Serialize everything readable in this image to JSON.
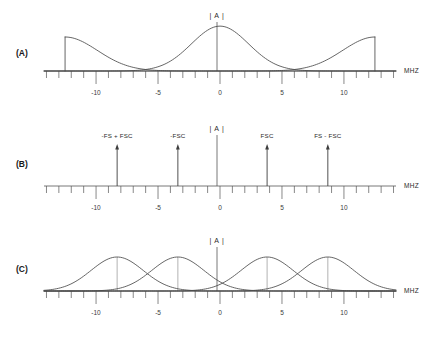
{
  "figure": {
    "background_color": "#ffffff",
    "line_color": "#4a4a4a",
    "axis_color": "#555555",
    "amplitude_label": "| A |",
    "frequency_unit_label": "MHZ"
  },
  "axis": {
    "min": -14.2,
    "max": 14.2,
    "tick_step": 1,
    "major_step": 5,
    "tick_labels": [
      {
        "value": -10,
        "text": "-10"
      },
      {
        "value": -5,
        "text": "-5"
      },
      {
        "value": 0,
        "text": "0"
      },
      {
        "value": 5,
        "text": "5"
      },
      {
        "value": 10,
        "text": "10"
      }
    ]
  },
  "panels": [
    {
      "id": "A",
      "label": "(A)",
      "amplitude_label": "| A |",
      "unit_label": "MHZ"
    },
    {
      "id": "B",
      "label": "(B)",
      "amplitude_label": "| A |",
      "unit_label": "MHZ"
    },
    {
      "id": "C",
      "label": "(C)",
      "amplitude_label": "| A |",
      "unit_label": "MHZ"
    }
  ],
  "chart_data": [
    {
      "type": "line",
      "panel": "A",
      "title": "",
      "xlabel": "MHZ",
      "ylabel": "| A |",
      "xlim": [
        -14.2,
        14.2
      ],
      "grid": false,
      "legend": "none",
      "description": "Baseband spectrum: full Gaussian centered at 0 with two truncated half-Gaussian alias lobes at the band edges",
      "components": [
        {
          "name": "left-alias-lobe",
          "shape": "half-gaussian-truncated",
          "center": -12.5,
          "sigma": 2.6,
          "peak": 1.0,
          "truncated_edge": -12.5,
          "tail_direction": "right"
        },
        {
          "name": "center-lobe",
          "shape": "gaussian",
          "center": 0,
          "sigma": 2.3,
          "peak": 1.32
        },
        {
          "name": "right-alias-lobe",
          "shape": "half-gaussian-truncated",
          "center": 12.5,
          "sigma": 2.6,
          "peak": 1.0,
          "truncated_edge": 12.5,
          "tail_direction": "left"
        }
      ]
    },
    {
      "type": "line",
      "panel": "B",
      "title": "",
      "xlabel": "MHZ",
      "ylabel": "| A |",
      "xlim": [
        -14.2,
        14.2
      ],
      "grid": false,
      "legend": "none",
      "description": "Line spectrum with four carrier spikes",
      "spikes": [
        {
          "x": -8.3,
          "height": 1.0,
          "label": "-FS + FSC"
        },
        {
          "x": -3.4,
          "height": 1.0,
          "label": "-FSC"
        },
        {
          "x": 3.8,
          "height": 1.0,
          "label": "FSC"
        },
        {
          "x": 8.7,
          "height": 1.0,
          "label": "FS - FSC"
        }
      ]
    },
    {
      "type": "line",
      "panel": "C",
      "title": "",
      "xlabel": "MHZ",
      "ylabel": "| A |",
      "xlim": [
        -14.2,
        14.2
      ],
      "grid": false,
      "legend": "none",
      "description": "Four Gaussian sidebands centered on the carrier frequencies of panel B",
      "components": [
        {
          "name": "lobe-1",
          "shape": "gaussian",
          "center": -8.3,
          "sigma": 2.1,
          "peak": 1.0
        },
        {
          "name": "lobe-2",
          "shape": "gaussian",
          "center": -3.4,
          "sigma": 2.1,
          "peak": 1.0
        },
        {
          "name": "lobe-3",
          "shape": "gaussian",
          "center": 3.8,
          "sigma": 2.1,
          "peak": 1.0
        },
        {
          "name": "lobe-4",
          "shape": "gaussian",
          "center": 8.7,
          "sigma": 2.1,
          "peak": 1.0
        }
      ]
    }
  ]
}
